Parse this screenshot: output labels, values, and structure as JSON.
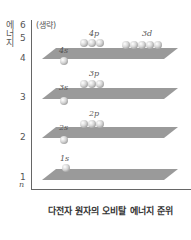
{
  "diagram": {
    "y_axis_label": [
      "에",
      "너",
      "지"
    ],
    "omitted_label": "(생략)",
    "ticks": [
      "6",
      "5",
      "4",
      "3",
      "2",
      "1"
    ],
    "n_label": "n",
    "caption": "다전자 원자의 오비탈 에너지 준위",
    "levels": [
      {
        "n": 4,
        "orbitals": [
          {
            "label": "4s",
            "count": 1
          },
          {
            "label": "4p",
            "count": 3
          },
          {
            "label": "3d",
            "count": 5
          }
        ]
      },
      {
        "n": 3,
        "orbitals": [
          {
            "label": "3s",
            "count": 1
          },
          {
            "label": "3p",
            "count": 3
          }
        ]
      },
      {
        "n": 2,
        "orbitals": [
          {
            "label": "2s",
            "count": 1
          },
          {
            "label": "2p",
            "count": 3
          }
        ]
      },
      {
        "n": 1,
        "orbitals": [
          {
            "label": "1s",
            "count": 1
          }
        ]
      }
    ],
    "colors": {
      "plane": "#9a9a9a",
      "sphere": "#dcdcdc",
      "axis": "#666666"
    }
  }
}
